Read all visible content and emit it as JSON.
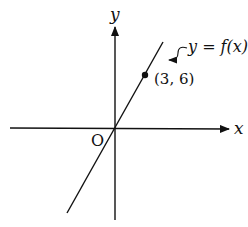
{
  "diagram": {
    "axes": {
      "x_label": "x",
      "y_label": "y",
      "origin_label": "O"
    },
    "function": {
      "label": "y = f(x)",
      "type": "line through origin"
    },
    "point": {
      "label": "(3, 6)",
      "x": 3,
      "y": 6
    },
    "colors": {
      "stroke": "#111111",
      "background": "#ffffff"
    }
  }
}
